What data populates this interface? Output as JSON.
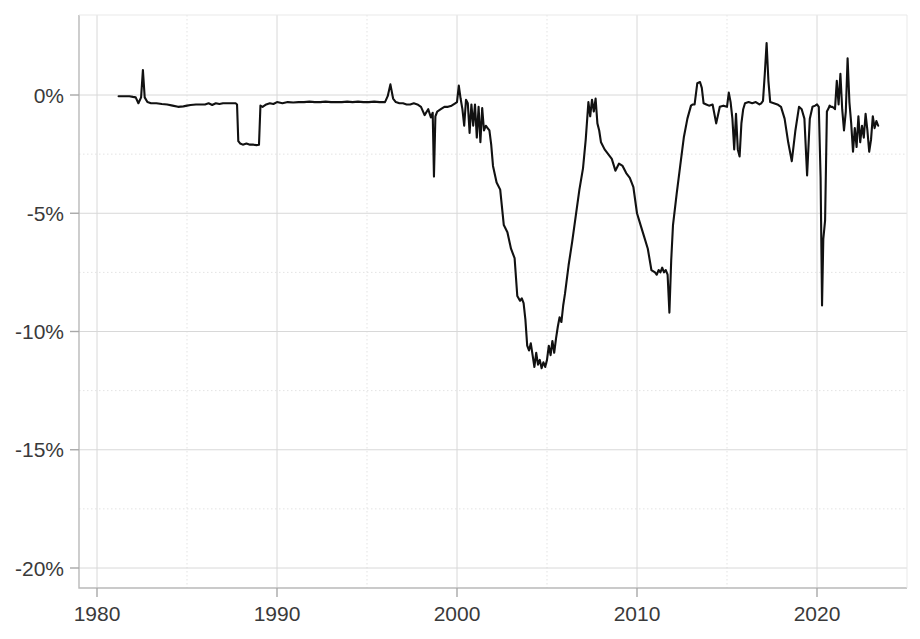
{
  "chart_data": {
    "type": "line",
    "title": "",
    "subtitle": "",
    "xlabel": "",
    "ylabel": "",
    "xlim": [
      1980,
      2024.1
    ],
    "ylim": [
      -21.0,
      1.6
    ],
    "grid": true,
    "legend_position": "none",
    "line_color": "#111111",
    "y_tick_labels": [
      "0%",
      "-5%",
      "-10%",
      "-15%",
      "-20%"
    ],
    "y_tick_values": [
      0,
      -5,
      -10,
      -15,
      -20
    ],
    "y_minor_tick_values": [
      -2.5,
      -7.5,
      -12.5,
      -17.5
    ],
    "x_tick_labels": [
      "1980",
      "1990",
      "2000",
      "2010",
      "2020"
    ],
    "x_tick_values": [
      1980,
      1990,
      2000,
      2010,
      2020
    ],
    "x_minor_tick_values": [
      1985,
      1995,
      2005,
      2015
    ],
    "series": [
      {
        "name": "drawdown",
        "x": [
          1981.2,
          1981.4,
          1981.6,
          1981.8,
          1982.0,
          1982.15,
          1982.3,
          1982.45,
          1982.55,
          1982.65,
          1982.8,
          1983.0,
          1983.3,
          1983.6,
          1983.9,
          1984.2,
          1984.5,
          1984.8,
          1985.0,
          1985.2,
          1985.5,
          1985.8,
          1986.0,
          1986.2,
          1986.4,
          1986.6,
          1986.8,
          1987.0,
          1987.2,
          1987.4,
          1987.55,
          1987.7,
          1987.78,
          1987.85,
          1987.95,
          1988.1,
          1988.3,
          1988.5,
          1988.7,
          1988.85,
          1888.95,
          1989.0,
          1989.08,
          1989.2,
          1989.4,
          1989.6,
          1989.8,
          1990.0,
          1990.3,
          1990.6,
          1990.9,
          1991.2,
          1991.5,
          1991.8,
          1992.1,
          1992.4,
          1992.7,
          1993.0,
          1993.3,
          1993.6,
          1993.9,
          1994.2,
          1994.5,
          1994.8,
          1995.1,
          1995.4,
          1995.7,
          1996.0,
          1996.15,
          1996.3,
          1996.45,
          1996.6,
          1996.8,
          1997.0,
          1997.2,
          1997.4,
          1997.6,
          1997.8,
          1998.0,
          1998.2,
          1998.4,
          1998.55,
          1998.65,
          1998.72,
          1998.8,
          1998.9,
          1999.1,
          1999.3,
          1999.5,
          1999.7,
          1999.9,
          2000.0,
          2000.1,
          2000.2,
          2000.3,
          2000.4,
          2000.5,
          2000.6,
          2000.7,
          2000.8,
          2000.9,
          2001.0,
          2001.1,
          2001.2,
          2001.3,
          2001.4,
          2001.5,
          2001.6,
          2001.7,
          2001.8,
          2001.9,
          2002.0,
          2002.2,
          2002.4,
          2002.6,
          2002.8,
          2003.0,
          2003.2,
          2003.35,
          2003.5,
          2003.6,
          2003.7,
          2003.8,
          2003.9,
          2004.0,
          2004.1,
          2004.2,
          2004.3,
          2004.4,
          2004.5,
          2004.6,
          2004.7,
          2004.8,
          2004.9,
          2005.0,
          2005.1,
          2005.2,
          2005.3,
          2005.4,
          2005.5,
          2005.6,
          2005.7,
          2005.8,
          2005.9,
          2006.0,
          2006.2,
          2006.4,
          2006.6,
          2006.8,
          2007.0,
          2007.15,
          2007.3,
          2007.4,
          2007.5,
          2007.6,
          2007.7,
          2007.8,
          2007.9,
          2008.0,
          2008.2,
          2008.4,
          2008.6,
          2008.8,
          2009.0,
          2009.2,
          2009.4,
          2009.6,
          2009.8,
          2010.0,
          2010.2,
          2010.4,
          2010.6,
          2010.8,
          2011.0,
          2011.1,
          2011.2,
          2011.3,
          2011.4,
          2011.5,
          2011.6,
          2011.7,
          2011.8,
          2011.9,
          2012.0,
          2012.2,
          2012.4,
          2012.6,
          2012.8,
          2013.0,
          2013.1,
          2013.2,
          2013.35,
          2013.5,
          2013.6,
          2013.7,
          2013.85,
          2014.0,
          2014.2,
          2014.4,
          2014.6,
          2014.8,
          2015.0,
          2015.1,
          2015.2,
          2015.3,
          2015.4,
          2015.5,
          2015.6,
          2015.7,
          2015.8,
          2015.9,
          2016.0,
          2016.2,
          2016.4,
          2016.6,
          2016.8,
          2016.9,
          2017.0,
          2017.1,
          2017.2,
          2017.3,
          2017.4,
          2017.6,
          2017.8,
          2018.0,
          2018.2,
          2018.4,
          2018.6,
          2018.8,
          2019.0,
          2019.15,
          2019.3,
          2019.45,
          2019.6,
          2019.75,
          2019.9,
          2020.0,
          2020.1,
          2020.2,
          2020.28,
          2020.35,
          2020.45,
          2020.55,
          2020.65,
          2020.7,
          2020.78,
          2020.85,
          2020.95,
          2021.0,
          2021.1,
          2021.2,
          2021.3,
          2021.4,
          2021.5,
          2021.6,
          2021.7,
          2021.8,
          2021.9,
          2022.0,
          2022.1,
          2022.2,
          2022.3,
          2022.4,
          2022.5,
          2022.6,
          2022.7,
          2022.8,
          2022.9,
          2023.0,
          2023.1,
          2023.2,
          2023.3,
          2023.4
        ],
        "y": [
          -0.05,
          -0.05,
          -0.05,
          -0.05,
          -0.08,
          -0.1,
          -0.35,
          -0.1,
          1.05,
          -0.1,
          -0.3,
          -0.35,
          -0.35,
          -0.38,
          -0.4,
          -0.45,
          -0.5,
          -0.48,
          -0.45,
          -0.42,
          -0.4,
          -0.4,
          -0.4,
          -0.35,
          -0.42,
          -0.35,
          -0.38,
          -0.35,
          -0.35,
          -0.35,
          -0.35,
          -0.35,
          -0.4,
          -1.95,
          -2.05,
          -2.1,
          -2.05,
          -2.1,
          -2.1,
          -2.12,
          -2.1,
          -2.1,
          -0.45,
          -0.5,
          -0.4,
          -0.35,
          -0.38,
          -0.3,
          -0.35,
          -0.3,
          -0.32,
          -0.3,
          -0.3,
          -0.28,
          -0.3,
          -0.3,
          -0.28,
          -0.3,
          -0.3,
          -0.3,
          -0.28,
          -0.3,
          -0.28,
          -0.3,
          -0.3,
          -0.28,
          -0.3,
          -0.3,
          -0.05,
          0.45,
          -0.15,
          -0.3,
          -0.35,
          -0.35,
          -0.4,
          -0.4,
          -0.35,
          -0.4,
          -0.5,
          -0.85,
          -0.6,
          -0.95,
          -0.75,
          -3.45,
          -0.9,
          -0.7,
          -0.6,
          -0.5,
          -0.5,
          -0.45,
          -0.35,
          -0.3,
          0.4,
          -0.15,
          -0.6,
          -1.3,
          -0.2,
          -0.35,
          -1.6,
          -0.4,
          -1.3,
          -0.4,
          -1.8,
          -0.5,
          -2.0,
          -0.55,
          -1.5,
          -1.3,
          -1.4,
          -1.5,
          -2.1,
          -3.0,
          -3.7,
          -4.0,
          -5.5,
          -5.8,
          -6.5,
          -6.9,
          -8.5,
          -8.7,
          -8.6,
          -8.8,
          -9.5,
          -10.6,
          -10.8,
          -10.5,
          -11.0,
          -11.5,
          -10.9,
          -11.4,
          -11.2,
          -11.55,
          -11.3,
          -11.5,
          -11.2,
          -10.6,
          -11.0,
          -10.4,
          -10.9,
          -10.3,
          -9.8,
          -9.4,
          -9.6,
          -8.9,
          -8.4,
          -7.2,
          -6.2,
          -5.1,
          -4.0,
          -3.1,
          -1.9,
          -0.3,
          -0.9,
          -0.2,
          -0.7,
          -0.15,
          -1.2,
          -1.5,
          -2.0,
          -2.3,
          -2.5,
          -2.7,
          -3.2,
          -2.9,
          -3.0,
          -3.3,
          -3.5,
          -3.9,
          -5.0,
          -5.5,
          -6.0,
          -6.5,
          -7.4,
          -7.5,
          -7.6,
          -7.4,
          -7.5,
          -7.3,
          -7.5,
          -7.4,
          -7.6,
          -9.2,
          -7.0,
          -5.5,
          -4.2,
          -3.0,
          -1.8,
          -1.0,
          -0.45,
          -0.4,
          -0.4,
          0.5,
          0.55,
          0.3,
          -0.35,
          -0.4,
          -0.45,
          -0.4,
          -1.2,
          -0.5,
          -0.45,
          -0.5,
          0.1,
          -0.3,
          -1.0,
          -2.3,
          -0.8,
          -2.3,
          -2.6,
          -1.2,
          -0.6,
          -0.35,
          -0.3,
          -0.35,
          -0.3,
          -0.4,
          -0.35,
          -0.25,
          0.9,
          2.2,
          0.6,
          -0.3,
          -0.35,
          -0.4,
          -0.5,
          -1.0,
          -2.0,
          -2.8,
          -1.5,
          -0.5,
          -0.6,
          -1.0,
          -3.4,
          -1.0,
          -0.5,
          -0.45,
          -0.4,
          -0.5,
          -3.5,
          -8.9,
          -6.1,
          -5.3,
          -0.7,
          -0.55,
          -0.45,
          -0.5,
          -0.5,
          -0.55,
          -0.6,
          0.6,
          -0.4,
          0.9,
          -0.6,
          -1.5,
          -0.7,
          1.55,
          -0.3,
          -1.2,
          -2.4,
          -1.4,
          -2.2,
          -0.9,
          -2.0,
          -1.3,
          -1.8,
          -0.8,
          -1.5,
          -2.4,
          -1.9,
          -0.9,
          -1.4,
          -1.1,
          -1.3
        ]
      }
    ]
  },
  "axes": {
    "plot_left_px": 79,
    "plot_right_px": 907,
    "plot_top_px": 15,
    "plot_bottom_px": 588
  }
}
